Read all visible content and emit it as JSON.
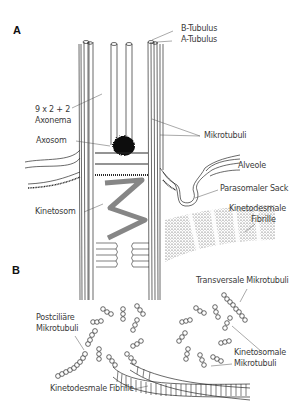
{
  "figure": {
    "panels": [
      {
        "id": "A",
        "label": "A"
      },
      {
        "id": "B",
        "label": "B"
      }
    ],
    "panel_a": {
      "labels": {
        "b_tubulus": "B-Tubulus",
        "a_tubulus": "A-Tubulus",
        "axonema_line1": "9 x 2 + 2",
        "axonema_line2": "Axonema",
        "axosom": "Axosom",
        "mikrotubuli": "Mikrotubuli",
        "alveole": "Alveole",
        "parasomaler_sack": "Parasomaler Sack",
        "kinetosom": "Kinetosom",
        "kinetodesmale_line1": "Kinetodesmale",
        "kinetodesmale_line2": "Fibrille"
      }
    },
    "panel_b": {
      "labels": {
        "transversale": "Transversale Mikrotubuli",
        "postciliaere_line1": "Postciliäre",
        "postciliaere_line2": "Mikrotubuli",
        "kinetosomale_line1": "Kinetosomale",
        "kinetosomale_line2": "Mikrotubuli",
        "kinetodesmale_fibrille": "Kinetodesmale Fibrille"
      }
    },
    "colors": {
      "line": "#2a2a2a",
      "label": "#3a3a3a",
      "stipple": "#1a1a1a",
      "background": "#ffffff"
    }
  }
}
